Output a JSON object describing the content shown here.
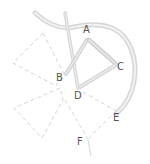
{
  "diagram": {
    "labels": {
      "A": "A",
      "B": "B",
      "C": "C",
      "D": "D",
      "E": "E",
      "F": "F"
    },
    "colors": {
      "thick_stroke": "#d9d9d9",
      "dashed_stroke": "#cfcfcf",
      "label": "#555555",
      "background": "#ffffff"
    }
  }
}
